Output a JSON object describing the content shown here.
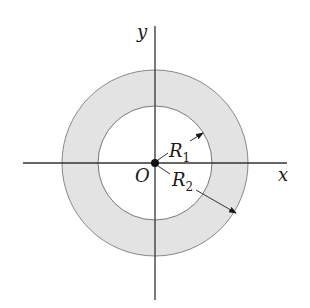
{
  "diagram": {
    "type": "annulus",
    "colors": {
      "ring_fill": "#e3e3e3",
      "stroke": "#777777",
      "axis": "#333333",
      "text": "#1a1a1a"
    },
    "axes": {
      "x_label": "x",
      "y_label": "y"
    },
    "origin_label": "O",
    "radii": [
      {
        "name": "R",
        "subscript": "1",
        "role": "inner radius"
      },
      {
        "name": "R",
        "subscript": "2",
        "role": "outer radius"
      }
    ]
  }
}
